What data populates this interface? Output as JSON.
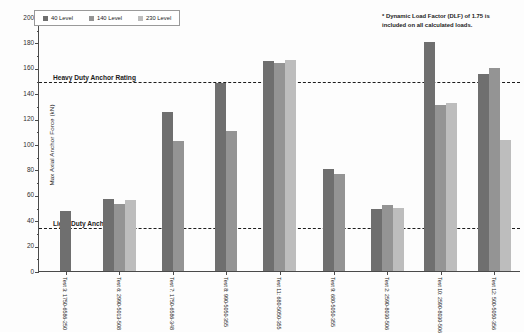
{
  "chart_data": {
    "type": "bar",
    "title": "",
    "xlabel": "",
    "ylabel": "Max Axial Anchor Force (kN)",
    "ylim": [
      0,
      200
    ],
    "ytick_step": 20,
    "yticks": [
      0,
      20,
      40,
      60,
      80,
      100,
      120,
      140,
      160,
      180,
      200
    ],
    "grid": false,
    "legend_position": "top-left",
    "categories": [
      "Test 3:\n1750-6586-250",
      "Test 6:\n2990-5013-508",
      "Test 7:\n1750-6586-348",
      "Test 8:\n990-5050-355",
      "Test 11:\n680-5050-355",
      "Test 9:\n680-5050-355",
      "Test 2:\n2590-8030-506",
      "Test 10:\n2590-8030-506",
      "Test 12:\n500-5050-356"
    ],
    "series": [
      {
        "name": "40 Level",
        "color": "#6f6f6f",
        "values": [
          47,
          57,
          125,
          148,
          165,
          80,
          49,
          180,
          155
        ]
      },
      {
        "name": "140 Level",
        "color": "#949494",
        "values": [
          null,
          53,
          102,
          110,
          164,
          76,
          52,
          131,
          160
        ]
      },
      {
        "name": "230 Level",
        "color": "#bdbdbd",
        "values": [
          null,
          56,
          null,
          null,
          166,
          null,
          50,
          132,
          103
        ]
      }
    ],
    "reference_lines": [
      {
        "label": "Heavy Duty Anchor Rating",
        "value": 150
      },
      {
        "label": "Light Duty Anchor Rating",
        "value": 35
      }
    ],
    "annotations": [
      "* Dynamic Load Factor (DLF) of 1.75 is",
      "included on all calculated loads."
    ]
  }
}
